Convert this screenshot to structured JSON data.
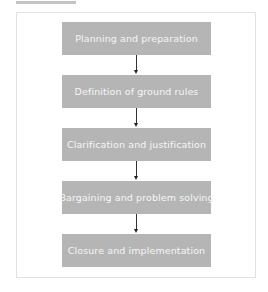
{
  "diagram": {
    "type": "vertical-flowchart",
    "steps": [
      {
        "label": "Planning and preparation"
      },
      {
        "label": "Definition of ground rules"
      },
      {
        "label": "Clarification and justification"
      },
      {
        "label": "Bargaining and problem solving"
      },
      {
        "label": "Closure and implementation"
      }
    ],
    "colors": {
      "box": "#b5b5b5",
      "box_text": "#f5f5f5",
      "arrow": "#333333",
      "frame_border": "#e2e2e2"
    }
  }
}
